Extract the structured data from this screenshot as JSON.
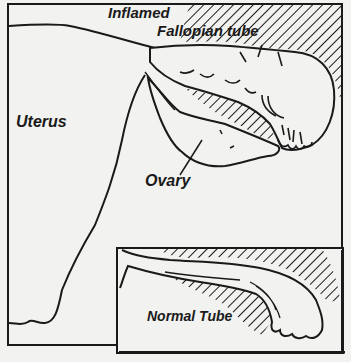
{
  "diagram": {
    "type": "anatomical-illustration",
    "background": "#f2f2f0",
    "ink_color": "#1a1a1a",
    "main_panel": {
      "labels": {
        "inflamed": "Inflamed",
        "fallopian": "Fallopian tube",
        "uterus": "Uterus",
        "ovary": "Ovary"
      }
    },
    "inset_panel": {
      "labels": {
        "normal": "Normal Tube"
      }
    }
  }
}
